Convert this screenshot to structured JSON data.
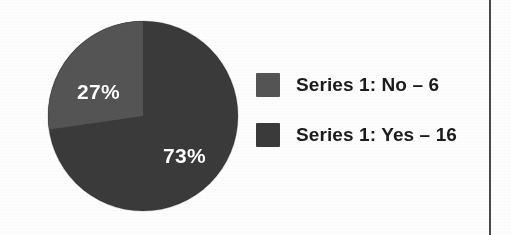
{
  "chart_data": {
    "type": "pie",
    "title": "",
    "categories": [
      "Series 1: No",
      "Series 1: Yes"
    ],
    "values": [
      6,
      16
    ],
    "percentages": [
      "27%",
      "73%"
    ],
    "labels": [
      "27%",
      "73%"
    ],
    "total": 22,
    "legend_position": "right",
    "grid": false,
    "slices": [
      {
        "name": "Series 1: No",
        "legend_label": "Series 1: No – 6",
        "count": 6,
        "percent": 27,
        "data_label": "27%",
        "color": "#545454"
      },
      {
        "name": "Series 1: Yes",
        "legend_label": "Series 1: Yes – 16",
        "count": 16,
        "percent": 73,
        "data_label": "73%",
        "color": "#3a3a3a"
      }
    ],
    "start_angle_deg": 0,
    "direction": "counterclockwise"
  },
  "colors": {
    "slice_no": "#545454",
    "slice_yes": "#3a3a3a",
    "data_label_text": "#ffffff",
    "legend_text": "#1c1c1c",
    "page_background": "#fdfdfd",
    "rule": "#4a4a4a"
  },
  "legend": {
    "items": [
      {
        "swatch_color": "#545454",
        "label": "Series 1: No – 6"
      },
      {
        "swatch_color": "#3a3a3a",
        "label": "Series 1: Yes – 16"
      }
    ]
  }
}
